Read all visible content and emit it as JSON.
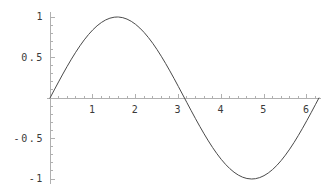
{
  "chart_data": {
    "type": "line",
    "title": "",
    "xlabel": "",
    "ylabel": "",
    "function": "sin(x)",
    "xlim": [
      -0.06,
      6.34
    ],
    "ylim": [
      -1.06,
      1.06
    ],
    "grid": false,
    "legend": null,
    "series": [
      {
        "name": "sin(x)",
        "color": "#4a4a4a",
        "x": [
          0,
          0.1,
          0.2,
          0.3,
          0.4,
          0.5,
          0.6,
          0.7,
          0.8,
          0.9,
          1.0,
          1.1,
          1.2,
          1.3,
          1.4,
          1.5,
          1.5708,
          1.6,
          1.7,
          1.8,
          1.9,
          2.0,
          2.1,
          2.2,
          2.3,
          2.4,
          2.5,
          2.6,
          2.7,
          2.8,
          2.9,
          3.0,
          3.1416,
          3.2,
          3.3,
          3.4,
          3.5,
          3.6,
          3.7,
          3.8,
          3.9,
          4.0,
          4.1,
          4.2,
          4.3,
          4.4,
          4.5,
          4.6,
          4.7124,
          4.8,
          4.9,
          5.0,
          5.1,
          5.2,
          5.3,
          5.4,
          5.5,
          5.6,
          5.7,
          5.8,
          5.9,
          6.0,
          6.1,
          6.2,
          6.2832
        ],
        "y": [
          0,
          0.0998,
          0.1987,
          0.2955,
          0.3894,
          0.4794,
          0.5646,
          0.6442,
          0.7174,
          0.7833,
          0.8415,
          0.8912,
          0.932,
          0.9636,
          0.9854,
          0.9975,
          1.0,
          0.9996,
          0.9917,
          0.9738,
          0.9463,
          0.9093,
          0.8632,
          0.8085,
          0.7457,
          0.6755,
          0.5985,
          0.5155,
          0.4274,
          0.335,
          0.2392,
          0.1411,
          0,
          -0.0584,
          -0.1577,
          -0.2555,
          -0.3508,
          -0.4425,
          -0.5298,
          -0.6119,
          -0.6878,
          -0.7568,
          -0.8183,
          -0.8716,
          -0.9162,
          -0.9516,
          -0.9775,
          -0.9937,
          -1.0,
          -0.9962,
          -0.9825,
          -0.9589,
          -0.9258,
          -0.8835,
          -0.8323,
          -0.7728,
          -0.7055,
          -0.6313,
          -0.5507,
          -0.4646,
          -0.3739,
          -0.2794,
          -0.1822,
          -0.0831,
          0
        ]
      }
    ],
    "axes": {
      "color": "#b0b0b0",
      "x_axis_at_y": 0,
      "y_axis_at_x": 0
    },
    "xticks": {
      "major_values": [
        1,
        2,
        3,
        4,
        5,
        6
      ],
      "major_labels": [
        "1",
        "2",
        "3",
        "4",
        "5",
        "6"
      ],
      "minor_step": 0.2
    },
    "yticks": {
      "major_values": [
        1,
        0.5,
        -0.5,
        -1
      ],
      "major_labels": [
        "1",
        "0.5",
        "-0.5",
        "-1"
      ],
      "minor_step": 0.1
    }
  }
}
